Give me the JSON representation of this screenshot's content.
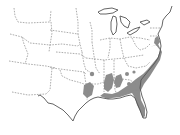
{
  "map": {
    "type": "species range map",
    "region": "Eastern and central United States",
    "labels": [],
    "legend": [],
    "colors": {
      "background": "#ffffff",
      "state_borders": "#8a8a8a",
      "coastline": "#555555",
      "range_fill": "#8c8c8c"
    },
    "range_description": "Shaded distribution along the southeastern coastal plain: eastern Texas / Louisiana, Mississippi, Alabama, Georgia, Florida, the Carolinas and southeastern Virginia"
  }
}
